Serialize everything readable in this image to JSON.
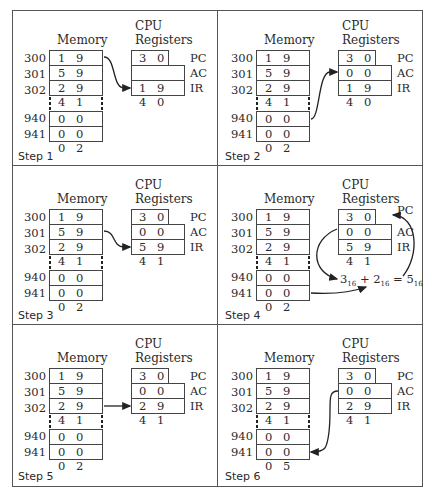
{
  "headers": {
    "memory": "Memory",
    "cpu_line1": "CPU",
    "cpu_line2": "Registers"
  },
  "register_labels": {
    "pc": "PC",
    "ac": "AC",
    "ir": "IR"
  },
  "steps": [
    {
      "label": "Step 1",
      "memory": [
        {
          "addr": "300",
          "value": "1 9 4 0"
        },
        {
          "addr": "301",
          "value": "5 9 4 1"
        },
        {
          "addr": "302",
          "value": "2 9 4 1"
        },
        {
          "addr": "940",
          "value": "0 0 0 3"
        },
        {
          "addr": "941",
          "value": "0 0 0 2"
        }
      ],
      "registers": {
        "pc": "3 0 0",
        "ac": "",
        "ir": "1 9 4 0"
      },
      "arrow": "memory 300 -> IR"
    },
    {
      "label": "Step 2",
      "memory": [
        {
          "addr": "300",
          "value": "1 9 4 0"
        },
        {
          "addr": "301",
          "value": "5 9 4 1"
        },
        {
          "addr": "302",
          "value": "2 9 4 1"
        },
        {
          "addr": "940",
          "value": "0 0 0 3"
        },
        {
          "addr": "941",
          "value": "0 0 0 2"
        }
      ],
      "registers": {
        "pc": "3 0 0",
        "ac": "0 0 0 3",
        "ir": "1 9 4 0"
      },
      "arrow": "memory 940 -> AC"
    },
    {
      "label": "Step 3",
      "memory": [
        {
          "addr": "300",
          "value": "1 9 4 0"
        },
        {
          "addr": "301",
          "value": "5 9 4 1"
        },
        {
          "addr": "302",
          "value": "2 9 4 1"
        },
        {
          "addr": "940",
          "value": "0 0 0 3"
        },
        {
          "addr": "941",
          "value": "0 0 0 2"
        }
      ],
      "registers": {
        "pc": "3 0 1",
        "ac": "0 0 0 3",
        "ir": "5 9 4 1"
      },
      "arrow": "memory 301 -> IR"
    },
    {
      "label": "Step 4",
      "memory": [
        {
          "addr": "300",
          "value": "1 9 4 0"
        },
        {
          "addr": "301",
          "value": "5 9 4 1"
        },
        {
          "addr": "302",
          "value": "2 9 4 1"
        },
        {
          "addr": "940",
          "value": "0 0 0 3"
        },
        {
          "addr": "941",
          "value": "0 0 0 2"
        }
      ],
      "registers": {
        "pc": "3 0 1",
        "ac": "0 0 0 5",
        "ir": "5 9 4 1"
      },
      "formula": {
        "a": "3",
        "b": "2",
        "result": "5",
        "base": "16"
      },
      "arrow": "AC + memory 941 -> AC"
    },
    {
      "label": "Step 5",
      "memory": [
        {
          "addr": "300",
          "value": "1 9 4 0"
        },
        {
          "addr": "301",
          "value": "5 9 4 1"
        },
        {
          "addr": "302",
          "value": "2 9 4 1"
        },
        {
          "addr": "940",
          "value": "0 0 0 3"
        },
        {
          "addr": "941",
          "value": "0 0 0 2"
        }
      ],
      "registers": {
        "pc": "3 0 2",
        "ac": "0 0 0 5",
        "ir": "2 9 4 1"
      },
      "arrow": "memory 302 -> IR"
    },
    {
      "label": "Step 6",
      "memory": [
        {
          "addr": "300",
          "value": "1 9 4 0"
        },
        {
          "addr": "301",
          "value": "5 9 4 1"
        },
        {
          "addr": "302",
          "value": "2 9 4 1"
        },
        {
          "addr": "940",
          "value": "0 0 0 3"
        },
        {
          "addr": "941",
          "value": "0 0 0 5"
        }
      ],
      "registers": {
        "pc": "3 0 2",
        "ac": "0 0 0 5",
        "ir": "2 9 4 1"
      },
      "arrow": "AC -> memory 941"
    }
  ]
}
